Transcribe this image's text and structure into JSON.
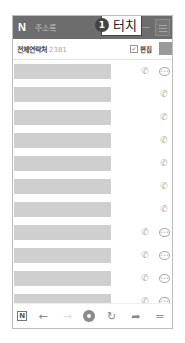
{
  "header": {
    "logo": "N",
    "title": "주소록",
    "callout_number": "1",
    "callout_text": "터치"
  },
  "subheader": {
    "label": "전체연락처",
    "count": "2381",
    "edit_checkbox": "✓",
    "edit_label": "편집"
  },
  "rows": [
    {
      "phone_icon": "phone-icon",
      "has_message": true
    },
    {
      "phone_icon": "phone-icon",
      "has_message": false
    },
    {
      "phone_icon": "phone-icon",
      "has_message": false
    },
    {
      "phone_icon": "phone-icon",
      "has_message": false
    },
    {
      "phone_icon": "phone-icon",
      "has_message": false
    },
    {
      "phone_icon": "phone-icon",
      "has_message": false
    },
    {
      "phone_icon": "phone-icon",
      "has_message": false
    },
    {
      "phone_icon": "phone-icon",
      "has_message": true
    },
    {
      "phone_icon": "phone-icon",
      "has_message": true
    },
    {
      "phone_icon": "phone-icon",
      "has_message": true
    },
    {
      "phone_icon": "phone-icon",
      "has_message": true
    },
    {
      "phone_icon": "phone-icon",
      "has_message": true
    }
  ],
  "icons": {
    "phone": "✆",
    "message": "•••",
    "back": "←",
    "forward": "→",
    "refresh": "↻",
    "share": "➦",
    "menu": "═",
    "naver": "N"
  },
  "colors": {
    "header_bg": "#6d6d6d",
    "name_bar": "#cfcfcf",
    "icon": "#aaaaaa"
  }
}
